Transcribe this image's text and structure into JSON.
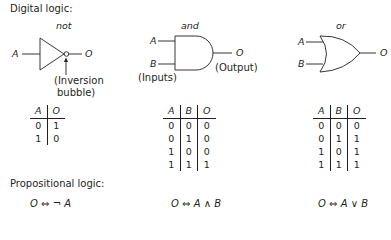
{
  "sections": {
    "digital_title": "Digital logic:",
    "propositional_title": "Propositional logic:"
  },
  "gates": [
    {
      "name": "not",
      "inputs": [
        "A"
      ],
      "output": "O",
      "annotation_line1": "(Inversion",
      "annotation_line2": "bubble)",
      "truth_table": {
        "headers": [
          "A",
          "O"
        ],
        "rows": [
          [
            "0",
            "1"
          ],
          [
            "1",
            "0"
          ]
        ]
      },
      "formula": {
        "lhs": "O",
        "iff": "⇔",
        "rhs": "¬ A"
      }
    },
    {
      "name": "and",
      "inputs": [
        "A",
        "B"
      ],
      "output": "O",
      "inputs_note": "(Inputs)",
      "output_note": "(Output)",
      "truth_table": {
        "headers": [
          "A",
          "B",
          "O"
        ],
        "rows": [
          [
            "0",
            "0",
            "0"
          ],
          [
            "0",
            "1",
            "0"
          ],
          [
            "1",
            "0",
            "0"
          ],
          [
            "1",
            "1",
            "1"
          ]
        ]
      },
      "formula": {
        "lhs": "O",
        "iff": "⇔",
        "rhs": "A ∧ B"
      }
    },
    {
      "name": "or",
      "inputs": [
        "A",
        "B"
      ],
      "output": "O",
      "truth_table": {
        "headers": [
          "A",
          "B",
          "O"
        ],
        "rows": [
          [
            "0",
            "0",
            "0"
          ],
          [
            "0",
            "1",
            "1"
          ],
          [
            "1",
            "0",
            "1"
          ],
          [
            "1",
            "1",
            "1"
          ]
        ]
      },
      "formula": {
        "lhs": "O",
        "iff": "⇔",
        "rhs": "A ∨ B"
      }
    }
  ]
}
